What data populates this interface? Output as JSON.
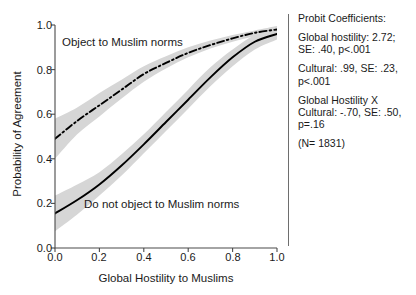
{
  "chart_data": {
    "type": "line",
    "title": "",
    "xlabel": "Global Hostility to Muslims",
    "ylabel": "Probability of Agreement",
    "xlim": [
      0.0,
      1.0
    ],
    "ylim": [
      0.0,
      1.0
    ],
    "xticks": [
      "0.0",
      "0.2",
      "0.4",
      "0.6",
      "0.8",
      "1.0"
    ],
    "yticks": [
      "0.0",
      "0.2",
      "0.4",
      "0.6",
      "0.8",
      "1.0"
    ],
    "grid": false,
    "legend_position": "inline-annotations",
    "x": [
      0.0,
      0.1,
      0.2,
      0.3,
      0.4,
      0.5,
      0.6,
      0.7,
      0.8,
      0.9,
      1.0
    ],
    "series": [
      {
        "name": "Object to Muslim norms",
        "style": "dash-dot",
        "color": "#000000",
        "values": [
          0.49,
          0.57,
          0.64,
          0.71,
          0.78,
          0.83,
          0.875,
          0.91,
          0.94,
          0.965,
          0.98
        ],
        "ci_lower": [
          0.4,
          0.51,
          0.59,
          0.67,
          0.745,
          0.805,
          0.855,
          0.895,
          0.925,
          0.95,
          0.965
        ],
        "ci_upper": [
          0.58,
          0.63,
          0.695,
          0.755,
          0.815,
          0.86,
          0.9,
          0.93,
          0.955,
          0.975,
          0.995
        ]
      },
      {
        "name": "Do not object to Muslim norms",
        "style": "solid",
        "color": "#000000",
        "values": [
          0.155,
          0.215,
          0.285,
          0.37,
          0.465,
          0.565,
          0.665,
          0.765,
          0.855,
          0.925,
          0.96
        ],
        "ci_lower": [
          0.075,
          0.15,
          0.235,
          0.325,
          0.425,
          0.525,
          0.625,
          0.725,
          0.815,
          0.89,
          0.935
        ],
        "ci_upper": [
          0.235,
          0.285,
          0.34,
          0.42,
          0.51,
          0.61,
          0.71,
          0.81,
          0.89,
          0.955,
          0.99
        ]
      }
    ],
    "band_color": "#d6d6d6",
    "annotations": [
      {
        "name": "object-to-muslim-norms",
        "text": "Object to Muslim norms"
      },
      {
        "name": "do-not-object-to-muslim-norms",
        "text": "Do not object to Muslim norms"
      }
    ]
  },
  "stats_panel": {
    "heading": "Probit Coefficients:",
    "lines": [
      "Global hostility: 2.72; SE: .40, p<.001",
      "Cultural: .99, SE: .23, p<.001",
      "Global Hostility X Cultural: -.70, SE: .50, p=.16",
      "(N= 1831)"
    ]
  }
}
